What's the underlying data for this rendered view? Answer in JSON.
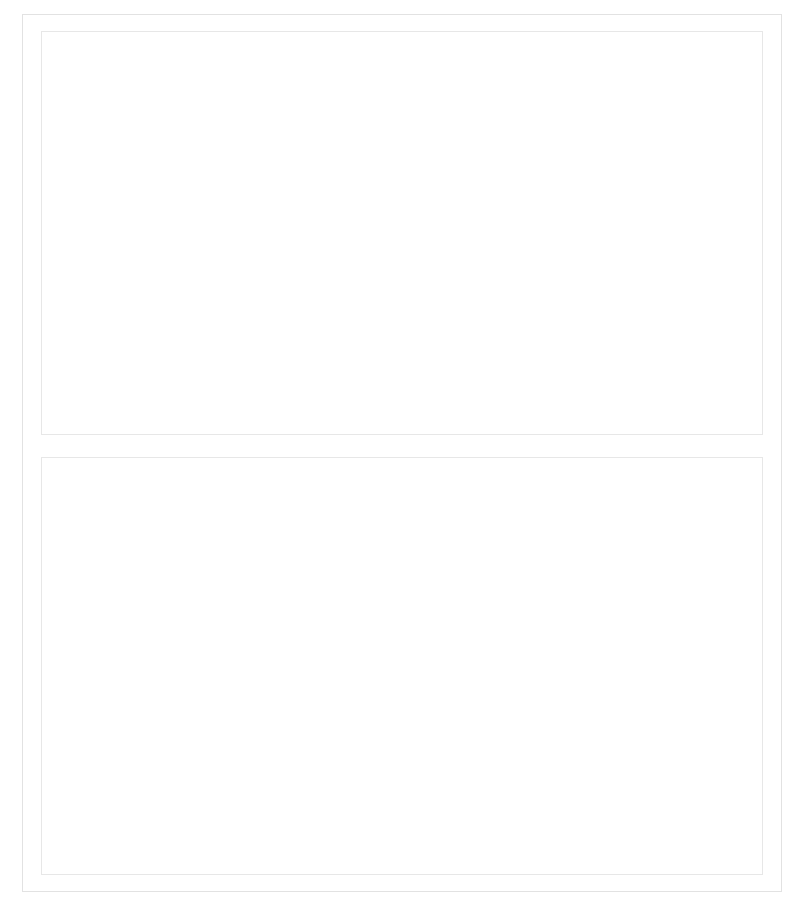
{
  "figure": {
    "panels": [
      "top",
      "bottom"
    ]
  },
  "chart_data": [
    {
      "id": "top",
      "type": "scatter",
      "title": "",
      "xlabel": "Ambulante Pflege",
      "ylabel": "Pflege durch Kind(er)",
      "xlim": [
        0,
        20
      ],
      "ylim": [
        0,
        10
      ],
      "xticks": [
        0,
        5,
        10,
        15,
        20
      ],
      "xticklabels": [
        "0%",
        "5%",
        "10%",
        "15%",
        "20%"
      ],
      "yticks": [
        0,
        5,
        10
      ],
      "yticklabels": [
        "0%",
        "5%",
        "10%"
      ],
      "grid": "horizontal",
      "legend": "none",
      "annotation": "r = -0.85***",
      "points": [
        {
          "label": "GR",
          "x": 0.4,
          "y": 4.85,
          "lx": -2,
          "ly": 30
        },
        {
          "label": "ES",
          "x": 1.2,
          "y": 8.75,
          "lx": 16,
          "ly": -10
        },
        {
          "label": "IT",
          "x": 1.6,
          "y": 6.8,
          "lx": 11,
          "ly": -10
        },
        {
          "label": "AU",
          "x": 3.0,
          "y": 5.9,
          "lx": 16,
          "ly": -10
        },
        {
          "label": "DE",
          "x": 3.0,
          "y": 4.95,
          "lx": -2,
          "ly": 30
        },
        {
          "label": "BE",
          "x": 5.9,
          "y": 2.45,
          "lx": -4,
          "ly": 30
        },
        {
          "label": "FR",
          "x": 6.9,
          "y": 3.05,
          "lx": 14,
          "ly": 22
        },
        {
          "label": "NL",
          "x": 7.9,
          "y": 0.85,
          "lx": 14,
          "ly": -9
        },
        {
          "label": "SE",
          "x": 12.9,
          "y": 1.2,
          "lx": -26,
          "ly": 30
        },
        {
          "label": "CH",
          "x": 13.0,
          "y": 1.4,
          "lx": 14,
          "ly": -10
        },
        {
          "label": "DK",
          "x": 16.9,
          "y": 0.7,
          "lx": 12,
          "ly": -10
        }
      ],
      "fitline": {
        "x1": 0.8,
        "y1": 6.2,
        "x2": 18.6,
        "y2": -0.6
      }
    },
    {
      "id": "bottom",
      "type": "scatter",
      "title": "",
      "xlabel": "Stationäre Pflege",
      "ylabel": "Pflege durch Kind(er)",
      "xlim": [
        0,
        15
      ],
      "ylim": [
        0,
        10
      ],
      "xticks": [
        0,
        5,
        10,
        15
      ],
      "xticklabels": [
        "0%",
        "5%",
        "10%",
        "15%"
      ],
      "yticks": [
        0,
        5,
        10
      ],
      "yticklabels": [
        "0%",
        "5%",
        "10%"
      ],
      "grid": "horizontal",
      "legend": "none",
      "annotation": "r = -0.56*",
      "points": [
        {
          "label": "GR",
          "x": 0.4,
          "y": 4.85,
          "lx": 10,
          "ly": -10
        },
        {
          "label": "IT",
          "x": 2.0,
          "y": 6.8,
          "lx": -4,
          "ly": -11
        },
        {
          "label": "ES",
          "x": 3.0,
          "y": 8.75,
          "lx": 13,
          "ly": -10
        },
        {
          "label": "FR",
          "x": 3.0,
          "y": 3.05,
          "lx": -7,
          "ly": -11
        },
        {
          "label": "BE",
          "x": 4.0,
          "y": 2.45,
          "lx": 9,
          "ly": -10
        },
        {
          "label": "DE",
          "x": 5.0,
          "y": 4.95,
          "lx": 11,
          "ly": -10
        },
        {
          "label": "SE",
          "x": 5.1,
          "y": 1.2,
          "lx": -10,
          "ly": -11
        },
        {
          "label": "DK",
          "x": 5.4,
          "y": 0.7,
          "lx": 7,
          "ly": 22
        },
        {
          "label": "AU",
          "x": 7.1,
          "y": 5.9,
          "lx": 11,
          "ly": -10
        },
        {
          "label": "CH",
          "x": 7.2,
          "y": 1.4,
          "lx": -9,
          "ly": -11
        },
        {
          "label": "NL",
          "x": 10.0,
          "y": 0.85,
          "lx": 12,
          "ly": -10
        }
      ],
      "fitline": {
        "x1": 0.7,
        "y1": 6.2,
        "x2": 10.0,
        "y2": 0.85
      }
    }
  ],
  "style": {
    "axis_color": "#3a3a3a",
    "grid_color": "#cfcfcf",
    "point_color": "#2b2b2b",
    "fit_color": "#3a3a3a",
    "text_color": "#1b1b1b"
  }
}
